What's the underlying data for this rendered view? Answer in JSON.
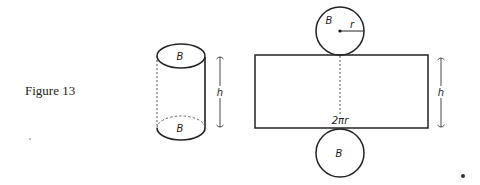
{
  "caption": "Figure 13",
  "cylinder": {
    "top_label": "B",
    "bottom_label": "B",
    "height_label": "h"
  },
  "net": {
    "top_circle_label": "B",
    "radius_label": "r",
    "rectangle_width_label": "2πr",
    "height_label": "h",
    "bottom_circle_label": "B"
  },
  "colors": {
    "stroke": "#222222",
    "background": "#ffffff"
  }
}
